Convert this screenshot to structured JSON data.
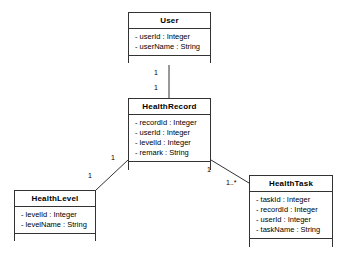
{
  "diagram": {
    "type": "uml-class-diagram",
    "background_color": "#ffffff",
    "line_color": "#333333",
    "text_color": "#000000"
  },
  "classes": [
    {
      "id": "user",
      "name": "User",
      "x": 128,
      "y": 12,
      "width": 83,
      "height": 51,
      "attributes": [
        "- userId : Integer",
        "- userName : String"
      ],
      "methods": []
    },
    {
      "id": "health_record",
      "name": "HealthRecord",
      "x": 128,
      "y": 98,
      "width": 83,
      "height": 72,
      "attributes": [
        "- recordId : Integer",
        "- userId : Integer",
        "- levelId : Integer",
        "- remark : String"
      ],
      "methods": []
    },
    {
      "id": "health_level",
      "name": "HealthLevel",
      "x": 14,
      "y": 190,
      "width": 82,
      "height": 51,
      "attributes": [
        "- levelId : Integer",
        "- levelName : String"
      ],
      "methods": []
    },
    {
      "id": "health_task",
      "name": "HealthTask",
      "x": 249,
      "y": 175,
      "width": 84,
      "height": 72,
      "attributes": [
        "- taskId : Integer",
        "- recordId : Integer",
        "- userId : Integer",
        "- taskName : String"
      ],
      "methods": []
    }
  ],
  "associations": [
    {
      "id": "user-healthrecord",
      "from": "user",
      "to": "health_record",
      "x1": 169,
      "y1": 63,
      "x2": 169,
      "y2": 98,
      "source_multiplicity": "1",
      "target_multiplicity": "1",
      "source_label_x": 154,
      "source_label_y": 69,
      "target_label_x": 154,
      "target_label_y": 84
    },
    {
      "id": "healthrecord-healthlevel",
      "from": "health_record",
      "to": "health_level",
      "x1": 128,
      "y1": 160,
      "x2": 96,
      "y2": 190,
      "source_multiplicity": "1",
      "target_multiplicity": "1",
      "source_label_x": 111,
      "source_label_y": 154,
      "target_label_x": 88,
      "target_label_y": 172
    },
    {
      "id": "healthrecord-healthtask",
      "from": "health_record",
      "to": "health_task",
      "x1": 211,
      "y1": 160,
      "x2": 249,
      "y2": 183,
      "source_multiplicity": "1",
      "target_multiplicity": "1..*",
      "source_label_x": 207,
      "source_label_y": 166,
      "target_label_x": 226,
      "target_label_y": 179
    }
  ]
}
